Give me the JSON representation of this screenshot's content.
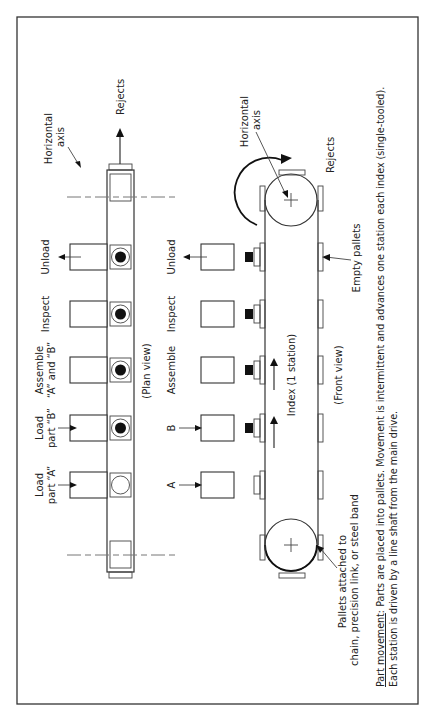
{
  "plan_view": {
    "caption": "(Plan view)",
    "axis_label_line1": "Horizontal",
    "axis_label_line2": "axis",
    "rejects_label": "Rejects",
    "stations": [
      {
        "line1": "Load",
        "line2": "part “A”",
        "arrow": "in",
        "part": "empty"
      },
      {
        "line1": "Load",
        "line2": "part “B”",
        "arrow": "in",
        "part": "filled"
      },
      {
        "line1": "Assemble",
        "line2": "“A” and “B”",
        "arrow": "none",
        "part": "filled"
      },
      {
        "line1": "Inspect",
        "line2": "",
        "arrow": "none",
        "part": "filled"
      },
      {
        "line1": "Unload",
        "line2": "",
        "arrow": "out",
        "part": "filled"
      }
    ]
  },
  "front_view": {
    "caption": "(Front view)",
    "axis_label_line1": "Horizontal",
    "axis_label_line2": "axis",
    "rejects_label": "Rejects",
    "index_label": "Index (1 station)",
    "empty_pallets_label": "Empty pallets",
    "pallets_label_line1": "Pallets attached to",
    "pallets_label_line2": "chain, precision link, or steel band",
    "stations": [
      {
        "label": "A",
        "arrow": "in",
        "tool": false
      },
      {
        "label": "B",
        "arrow": "in",
        "tool": true
      },
      {
        "label": "Assemble",
        "arrow": "none",
        "tool": true
      },
      {
        "label": "Inspect",
        "arrow": "none",
        "tool": true
      },
      {
        "label": "Unload",
        "arrow": "out",
        "tool": true
      }
    ]
  },
  "caption": {
    "heading": "Part movement",
    "line1_rest": ": Parts are placed into pallets. Movement is intermittent and advances one station each index (single-tooled).",
    "line2": "Each station is driven by a line shaft from the main drive."
  }
}
